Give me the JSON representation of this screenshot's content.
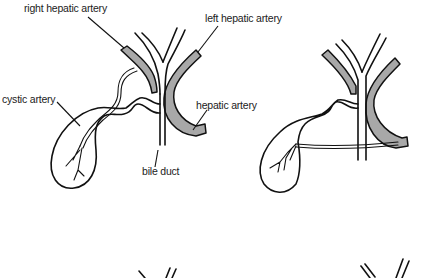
{
  "diagram": {
    "colors": {
      "background": "#ffffff",
      "line": "#111111",
      "artery_fill": "#a8a8a8",
      "label": "#222222"
    },
    "figures": [
      {
        "id": "variant-1",
        "description": "Cystic artery arising from right hepatic artery",
        "labels": [
          {
            "text": "right hepatic artery",
            "target": "right-hepatic-artery"
          },
          {
            "text": "left hepatic artery",
            "target": "left-hepatic-artery"
          },
          {
            "text": "cystic artery",
            "target": "cystic-artery"
          },
          {
            "text": "hepatic artery",
            "target": "common-hepatic-artery"
          },
          {
            "text": "bile duct",
            "target": "common-bile-duct"
          }
        ]
      },
      {
        "id": "variant-2",
        "description": "Cystic artery arising from common hepatic artery, crossing anterior to bile duct",
        "labels": []
      },
      {
        "id": "variant-3",
        "description": "Partially visible figure (bottom left, cropped)",
        "labels": []
      },
      {
        "id": "variant-4",
        "description": "Partially visible figure (bottom right, cropped)",
        "labels": []
      }
    ]
  }
}
